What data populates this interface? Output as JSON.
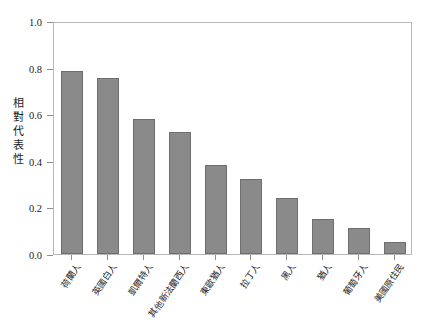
{
  "chart_data": {
    "type": "bar",
    "title": "",
    "subtitle": "",
    "xlabel": "",
    "ylabel": "相對代表性",
    "ylabel_chars": [
      "相",
      "對",
      "代",
      "表",
      "性"
    ],
    "categories": [
      "荷蘭人",
      "英國白人",
      "凱爾特人",
      "其他新法蘭西人",
      "東歐猶人",
      "拉丁人",
      "黑人",
      "猶人",
      "葡萄牙人",
      "美國原住民"
    ],
    "values": [
      0.785,
      0.755,
      0.58,
      0.525,
      0.38,
      0.32,
      0.24,
      0.15,
      0.11,
      0.05
    ],
    "ylim": [
      0.0,
      1.0
    ],
    "yticks": [
      0.0,
      0.2,
      0.4,
      0.6,
      0.8,
      1.0
    ],
    "ytick_labels": [
      "0.0",
      "0.2",
      "0.4",
      "0.6",
      "0.8",
      "1.0"
    ],
    "grid": false,
    "legend": null,
    "legend_position": "none",
    "bar_color": "#8a8a8a",
    "bar_edge_color": "#6f6f6f",
    "frame_color": "#b8b8b8",
    "text_color": "#1c1c1c",
    "background": "#ffffff",
    "xtick_rotation_deg": -55
  }
}
